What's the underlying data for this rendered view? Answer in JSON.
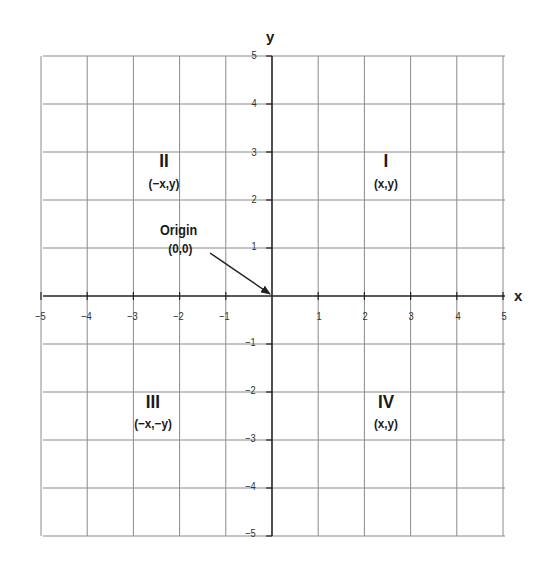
{
  "axes": {
    "x_label": "x",
    "y_label": "y",
    "x_ticks": [
      "−5",
      "−4",
      "−3",
      "−2",
      "−1",
      "1",
      "2",
      "3",
      "4",
      "5"
    ],
    "y_ticks_pos": [
      "5",
      "4",
      "3",
      "2",
      "1"
    ],
    "y_ticks_neg": [
      "−1",
      "−2",
      "−3",
      "−4",
      "−5"
    ]
  },
  "quadrants": {
    "I": {
      "numeral": "I",
      "coords": "(x,y)"
    },
    "II": {
      "numeral": "II",
      "coords": "(−x,y)"
    },
    "III": {
      "numeral": "III",
      "coords": "(−x,−y)"
    },
    "IV": {
      "numeral": "IV",
      "coords": "(x,y)"
    }
  },
  "origin": {
    "title": "Origin",
    "coords": "(0,0)"
  },
  "colors": {
    "grid": "#8a8a8a",
    "axis": "#222222",
    "text": "#1a1a1a"
  },
  "chart_data": {
    "type": "cartesian-plane",
    "title": "",
    "xlabel": "x",
    "ylabel": "y",
    "xlim": [
      -5,
      5
    ],
    "ylim": [
      -5,
      5
    ],
    "grid": true,
    "grid_step": 1,
    "annotations": [
      {
        "text": "I (x,y)",
        "x": 2.5,
        "y": 2.5
      },
      {
        "text": "II (−x,y)",
        "x": -2.5,
        "y": 2.5
      },
      {
        "text": "III (−x,−y)",
        "x": -2.5,
        "y": -2.5
      },
      {
        "text": "IV (x,y)",
        "x": 2.5,
        "y": -2.5
      },
      {
        "text": "Origin (0,0)",
        "arrow_to": [
          0,
          0
        ]
      }
    ]
  }
}
